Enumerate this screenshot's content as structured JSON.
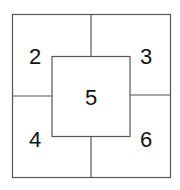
{
  "diagram": {
    "line_color": "#555555",
    "regions": [
      {
        "id": "top-left",
        "label": "2"
      },
      {
        "id": "top-right",
        "label": "3"
      },
      {
        "id": "center",
        "label": "5"
      },
      {
        "id": "bottom-left",
        "label": "4"
      },
      {
        "id": "bottom-right",
        "label": "6"
      }
    ]
  }
}
